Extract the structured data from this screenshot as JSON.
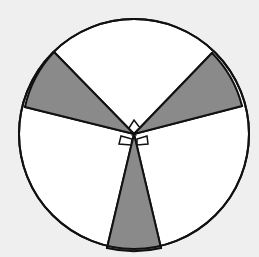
{
  "figure": {
    "type": "circle-with-shaded-sectors",
    "background": "#efefef",
    "circle": {
      "cx": 134,
      "cy": 134,
      "r": 115,
      "fill": "#ffffff",
      "stroke": "#111111"
    },
    "shade_color": "#8a8a8a",
    "sectors": [
      {
        "name": "upper-left",
        "points": "134,134 54,52 25,107"
      },
      {
        "name": "upper-right",
        "points": "134,134 212,53 242,106"
      },
      {
        "name": "bottom",
        "points": "134,134 107,248 161,248"
      }
    ],
    "right_angle_markers": 3
  }
}
